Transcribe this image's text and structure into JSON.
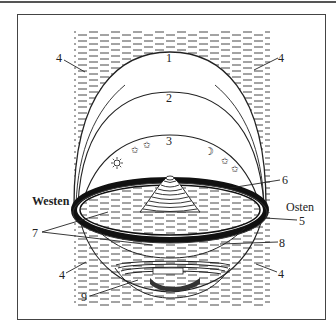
{
  "diagram": {
    "type": "worldview-cosmology",
    "directions": {
      "west": "Westen",
      "east": "Osten"
    },
    "labels": {
      "n1": "1",
      "n2": "2",
      "n3": "3",
      "n4_top_left": "4",
      "n4_top_right": "4",
      "n4_bottom_left": "4",
      "n4_bottom_right": "4",
      "n5": "5",
      "n6": "6",
      "n7": "7",
      "n8": "8",
      "n9": "9"
    },
    "celestial_icons": [
      "sun-icon",
      "star-icon",
      "star-icon",
      "moon-icon",
      "star-icon",
      "star-icon"
    ],
    "colors": {
      "ink": "#222222",
      "frame": "#444444",
      "background": "#ffffff"
    }
  }
}
